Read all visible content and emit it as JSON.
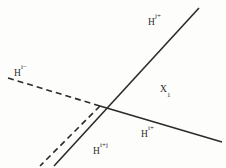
{
  "figure": {
    "name": "hyperplane-arrangement-diagram",
    "background_color": "#fdfdfc",
    "stroke_color": "#2b2b2b"
  },
  "lines": [
    {
      "name": "hyperplane-hj-plus-solid",
      "style": "solid",
      "x1": 54,
      "y1": 166,
      "x2": 199,
      "y2": 8,
      "width": 1.6
    },
    {
      "name": "hyperplane-hi-plus-solid",
      "style": "solid",
      "x1": 100,
      "y1": 106,
      "x2": 222,
      "y2": 142,
      "width": 1.6
    },
    {
      "name": "hyperplane-hi-minus-dashed",
      "style": "dashed",
      "x1": 8,
      "y1": 78,
      "x2": 100,
      "y2": 106,
      "width": 1.6,
      "dash": "6 4"
    },
    {
      "name": "hyperplane-hi-plus-j-dashed",
      "style": "dashed",
      "x1": 100,
      "y1": 106,
      "x2": 40,
      "y2": 166,
      "width": 1.6,
      "dash": "6 4"
    }
  ],
  "labels": {
    "hj_plus": {
      "base": "H",
      "sup": "j+"
    },
    "hi_minus": {
      "base": "H",
      "sup": "i−"
    },
    "x1": {
      "base": "X",
      "sub": "1"
    },
    "hi_plus": {
      "base": "H",
      "sup": "i+"
    },
    "hi_plus_j": {
      "base": "H",
      "sup": "i+j"
    }
  }
}
